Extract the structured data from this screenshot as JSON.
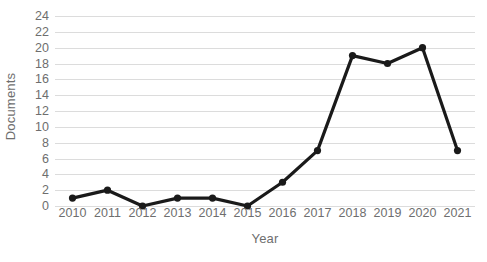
{
  "chart_data": {
    "type": "line",
    "title": "",
    "xlabel": "Year",
    "ylabel": "Documents",
    "categories": [
      "2010",
      "2011",
      "2012",
      "2013",
      "2014",
      "2015",
      "2016",
      "2017",
      "2018",
      "2019",
      "2020",
      "2021"
    ],
    "values": [
      1,
      2,
      0,
      1,
      1,
      0,
      3,
      7,
      19,
      18,
      20,
      7
    ],
    "series": [
      {
        "name": "Documents",
        "values": [
          1,
          2,
          0,
          1,
          1,
          0,
          3,
          7,
          19,
          18,
          20,
          7
        ]
      }
    ],
    "ylim": [
      0,
      24
    ],
    "ytick_step": 2,
    "yticks": [
      24,
      22,
      20,
      18,
      16,
      14,
      12,
      10,
      8,
      6,
      4,
      2,
      0
    ],
    "grid": "horizontal",
    "legend": "none",
    "marker": "circle",
    "colors": {
      "line": "#1a1a1a",
      "marker": "#1a1a1a",
      "gridline": "#dcdcdc",
      "text": "#6e6e6e",
      "background": "#ffffff"
    }
  }
}
